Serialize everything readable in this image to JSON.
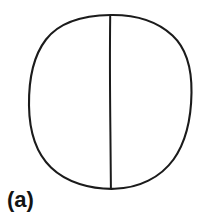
{
  "figure": {
    "label": "(a)",
    "caption_text": "(a)",
    "canvas": {
      "width": 207,
      "height": 216,
      "background_color": "#ffffff"
    },
    "ink_color": "#1b1b1b",
    "shapes": {
      "circle": {
        "name": "circle-outline",
        "center_x": 110,
        "center_y": 101,
        "radius_x": 81,
        "radius_y": 87,
        "stroke_width": 2.1,
        "style": "hand-drawn",
        "path": "M 110.5 15.0 C 136 14.6 158 22.0 172.5 35.5 C 186.5 48.5 191.8 68.0 191.5 92.5 C 191.2 117.0 187.0 140.5 173.5 159.5 C 160.5 177.5 139.0 188.2 114.5 188.8 C 90.5 189.4 66.5 182.5 51.0 167.5 C 35.5 152.5 29.3 130.0 29.0 105.5 C 28.7 81.5 32.5 57.0 46.0 39.5 C 59.5 22.0 84.0 15.4 110.5 15.0 Z"
      },
      "vertical_line": {
        "name": "divider-line",
        "x_top": 110.0,
        "y_top": 16.5,
        "x_bottom": 110.8,
        "y_bottom": 188.0,
        "stroke_width": 2.0,
        "path": "M 110.2 16.5 C 109.7 55.0 110.0 95.0 110.4 132.0 C 110.6 152.0 110.8 172.0 110.9 188.0"
      }
    }
  }
}
